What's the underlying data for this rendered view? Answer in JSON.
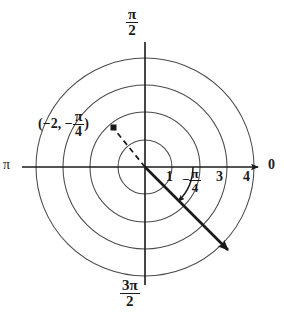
{
  "figure": {
    "type": "polar-diagram",
    "background_color": "#ffffff",
    "ink_color": "#1a1a1a",
    "grid_color": "#4a4a4a",
    "center": {
      "x": 145,
      "y": 167
    },
    "circles": [
      {
        "label": "1",
        "radius_px": 27
      },
      {
        "label": "2",
        "radius_px": 55
      },
      {
        "label": "3",
        "radius_px": 82
      },
      {
        "label": "4",
        "radius_px": 109
      }
    ],
    "axis_labels": {
      "right": "0",
      "left": "π",
      "top_numerator": "π",
      "top_denominator": "2",
      "bottom_numerator": "3π",
      "bottom_denominator": "2"
    },
    "radial_ticks": [
      {
        "label": "1",
        "value": 1
      },
      {
        "label": "3",
        "value": 3
      },
      {
        "label": "4",
        "value": 4
      }
    ],
    "angle_annotation": {
      "sign": "−",
      "numerator": "π",
      "denominator": "4",
      "value_radians": -0.7853981634,
      "direction": "clockwise from positive polar axis"
    },
    "point_annotation": {
      "open_paren": "(",
      "r_text": "−2,",
      "theta_sign": "−",
      "theta_numerator": "π",
      "theta_denominator": "4",
      "close_paren": ")",
      "r": -2,
      "theta_radians": -0.7853981634,
      "plotted_at": {
        "x": 113,
        "y": 128
      }
    },
    "ray": {
      "style": "solid-with-arrowhead",
      "from": {
        "x": 145,
        "y": 167
      },
      "to": {
        "x": 233,
        "y": 255
      },
      "description": "terminal side of the angle -pi/4"
    },
    "dashed_segment": {
      "style": "dashed",
      "from": {
        "x": 145,
        "y": 167
      },
      "to": {
        "x": 113,
        "y": 128
      },
      "description": "extension of the ray in the opposite direction to the point"
    },
    "top_crop_artifact": "˙ ˙"
  }
}
